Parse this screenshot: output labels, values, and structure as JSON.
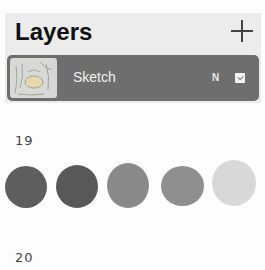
{
  "layers_panel": {
    "title": "Layers",
    "add_icon": "plus-icon",
    "layers": [
      {
        "name": "Sketch",
        "blend_mode": "N",
        "visible": true,
        "thumbnail": "sketch-thumbnail"
      }
    ]
  },
  "annotations": {
    "label_1": "19",
    "label_2": "20"
  },
  "swatches": [
    {
      "color": "#5e5e5e"
    },
    {
      "color": "#585858"
    },
    {
      "color": "#8a8a8a"
    },
    {
      "color": "#8f8f8f"
    },
    {
      "color": "#d8d8d8"
    }
  ]
}
